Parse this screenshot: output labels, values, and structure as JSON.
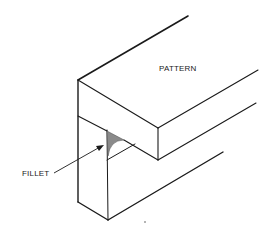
{
  "figure": {
    "type": "isometric technical drawing",
    "labels": {
      "pattern": "PATTERN",
      "fillet": "FILLET"
    },
    "colors": {
      "line": "#1a1a1a",
      "fillet_fill": "#8a8a8a",
      "background": "#ffffff"
    }
  }
}
